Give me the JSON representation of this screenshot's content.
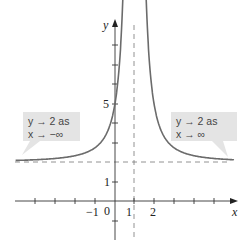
{
  "chart_data": {
    "type": "line",
    "function": "y = 2 + 3/(x-1)^2",
    "series": [
      {
        "name": "curve",
        "color": "#6b6b6b"
      }
    ],
    "xlabel": "x",
    "ylabel": "y",
    "x_ticks": [
      -5,
      -4,
      -3,
      -2,
      -1,
      1,
      2,
      3,
      4,
      5,
      6
    ],
    "x_tick_labels": {
      "neg1": "−1",
      "zero": "0",
      "one": "1",
      "two": "2"
    },
    "y_ticks": [
      -1,
      1,
      2,
      3,
      4,
      5,
      6,
      7,
      8
    ],
    "y_tick_labels": {
      "one": "1",
      "five": "5"
    },
    "asymptotes": {
      "horizontal": 2,
      "vertical": 1
    },
    "xlim": [
      -5.9,
      6.7
    ],
    "ylim": [
      -1.5,
      9.2
    ],
    "annotations": [
      {
        "line1": "y → 2 as",
        "line2": "x → −∞",
        "position": "left"
      },
      {
        "line1": "y → 2 as",
        "line2": "x → ∞",
        "position": "right"
      }
    ],
    "grid": false
  }
}
